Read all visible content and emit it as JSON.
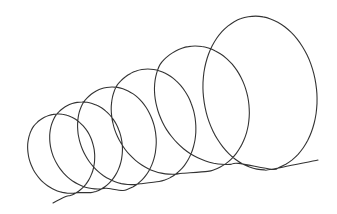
{
  "figure": {
    "width": 337,
    "height": 214,
    "background": "#ffffff",
    "stroke_color": "#333333",
    "stroke_width": 1.1
  },
  "coil": {
    "start": [
      53,
      203
    ],
    "end": [
      318,
      160
    ],
    "loops": [
      {
        "left": 21,
        "top": 114,
        "right": 98,
        "bottom": 197
      },
      {
        "left": 42,
        "top": 102,
        "right": 126,
        "bottom": 193
      },
      {
        "left": 69,
        "top": 87,
        "right": 160,
        "bottom": 191
      },
      {
        "left": 101,
        "top": 69,
        "right": 200,
        "bottom": 182
      },
      {
        "left": 142,
        "top": 46,
        "right": 254,
        "bottom": 172
      },
      {
        "left": 198,
        "top": 16,
        "right": 322,
        "bottom": 170
      }
    ]
  }
}
